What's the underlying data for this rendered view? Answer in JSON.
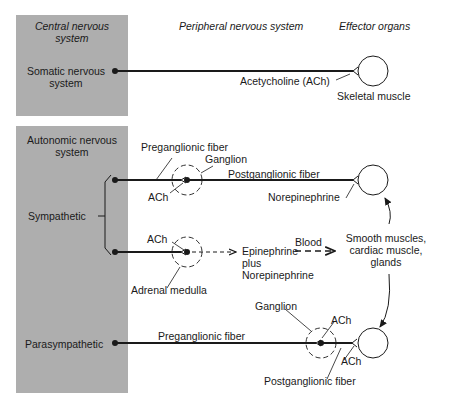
{
  "headers": {
    "central": "Central nervous system",
    "central_line1": "Central nervous",
    "central_line2": "system",
    "peripheral": "Peripheral nervous system",
    "effector": "Effector organs"
  },
  "somatic": {
    "label_line1": "Somatic nervous",
    "label_line2": "system",
    "neurotransmitter": "Acetycholine (ACh)",
    "target": "Skeletal muscle"
  },
  "autonomic": {
    "title_line1": "Autonomic nervous",
    "title_line2": "system",
    "sympathetic": {
      "label": "Sympathetic",
      "preganglionic": "Preganglionic fiber",
      "ganglion": "Ganglion",
      "ganglion_nt": "ACh",
      "postganglionic": "Postganglionic fiber",
      "effector_nt": "Norepinephrine"
    },
    "adrenal": {
      "nt": "ACh",
      "organ": "Adrenal medulla",
      "output_line1": "Epinephrine",
      "output_line2": "plus",
      "output_line3": "Norepinephrine",
      "route": "Blood"
    },
    "targets": {
      "line1": "Smooth muscles,",
      "line2": "cardiac muscle,",
      "line3": "glands"
    },
    "parasympathetic": {
      "label": "Parasympathetic",
      "preganglionic": "Preganglionic fiber",
      "ganglion": "Ganglion",
      "ganglion_nt": "ACh",
      "effector_nt": "ACh",
      "postganglionic": "Postganglionic fiber"
    }
  },
  "colors": {
    "panel": "#aeaeae",
    "line": "#1a1a1a"
  }
}
